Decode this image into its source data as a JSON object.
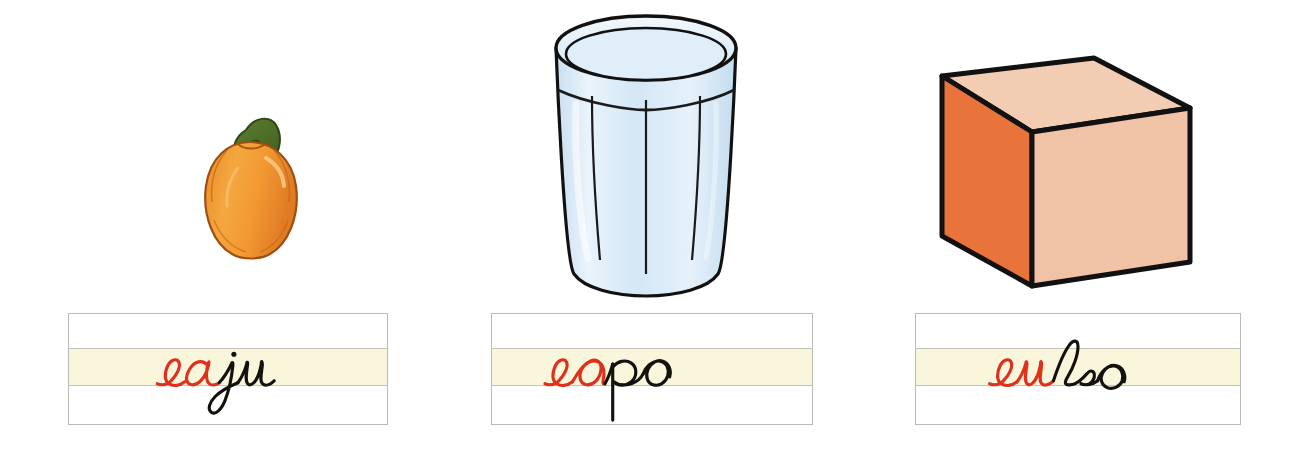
{
  "page": {
    "background_color": "#ffffff",
    "width": 1299,
    "height": 450
  },
  "palette": {
    "ink_red": "#e0301c",
    "ink_black": "#14120f",
    "card_band": "#faf6dc",
    "card_border": "#b9b9b5",
    "card_line": "#c3c3bb",
    "fruit_orange": "#f09234",
    "fruit_orange_dark": "#e2742a",
    "nut_green": "#4e7028",
    "glass_blue": "#d7e8f5",
    "glass_blue_light": "#eef6fc",
    "cube_left": "#e8743c",
    "cube_front": "#f0c2a6",
    "cube_top": "#f3cdb3",
    "outline": "#141414"
  },
  "columns": [
    {
      "id": "caju",
      "picture": {
        "name": "cashew-fruit-illustration",
        "label": "caju",
        "description": "Fruta caju laranja com castanha verde no topo",
        "colors": {
          "body": "#f09234",
          "nut": "#4e7028"
        }
      },
      "card": {
        "name": "handwriting-card-caju",
        "word": "caju",
        "syllable_red": "ca",
        "rest_black": "ju",
        "band_color": "#faf6dc"
      }
    },
    {
      "id": "copo",
      "picture": {
        "name": "drinking-glass-illustration",
        "label": "copo",
        "description": "Copo de vidro azul claro com estrias verticais",
        "colors": {
          "body": "#d7e8f5",
          "highlight": "#eef6fc"
        }
      },
      "card": {
        "name": "handwriting-card-copo",
        "word": "copo",
        "syllable_red": "co",
        "rest_black": "po",
        "band_color": "#faf6dc"
      }
    },
    {
      "id": "cubo",
      "picture": {
        "name": "cube-illustration",
        "label": "cubo",
        "description": "Cubo tridimensional laranja e salmao",
        "colors": {
          "left": "#e8743c",
          "front": "#f0c2a6",
          "top": "#f3cdb3"
        }
      },
      "card": {
        "name": "handwriting-card-cubo",
        "word": "cubo",
        "syllable_red": "cu",
        "rest_black": "bo",
        "band_color": "#faf6dc"
      }
    }
  ]
}
